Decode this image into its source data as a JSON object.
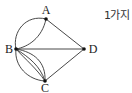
{
  "diagram": {
    "nodes": [
      {
        "id": "A",
        "label": "A",
        "x": 46,
        "y": 19,
        "lx": 46,
        "ly": 14
      },
      {
        "id": "B",
        "label": "B",
        "x": 16,
        "y": 49,
        "lx": 9,
        "ly": 53
      },
      {
        "id": "C",
        "label": "C",
        "x": 45,
        "y": 81,
        "lx": 45,
        "ly": 91
      },
      {
        "id": "D",
        "label": "D",
        "x": 84,
        "y": 49,
        "lx": 93,
        "ly": 53
      }
    ],
    "edges": [
      {
        "from": "A",
        "to": "B",
        "type": "curve-outer"
      },
      {
        "from": "A",
        "to": "B",
        "type": "curve-inner"
      },
      {
        "from": "A",
        "to": "D",
        "type": "straight"
      },
      {
        "from": "B",
        "to": "D",
        "type": "straight"
      },
      {
        "from": "B",
        "to": "C",
        "type": "curve-outer"
      },
      {
        "from": "B",
        "to": "C",
        "type": "lens-1"
      },
      {
        "from": "B",
        "to": "C",
        "type": "lens-2"
      },
      {
        "from": "B",
        "to": "C",
        "type": "curve-inner"
      },
      {
        "from": "C",
        "to": "D",
        "type": "straight"
      }
    ],
    "colors": {
      "line": "#333333",
      "node": "#111111"
    }
  },
  "answer": "1가지"
}
